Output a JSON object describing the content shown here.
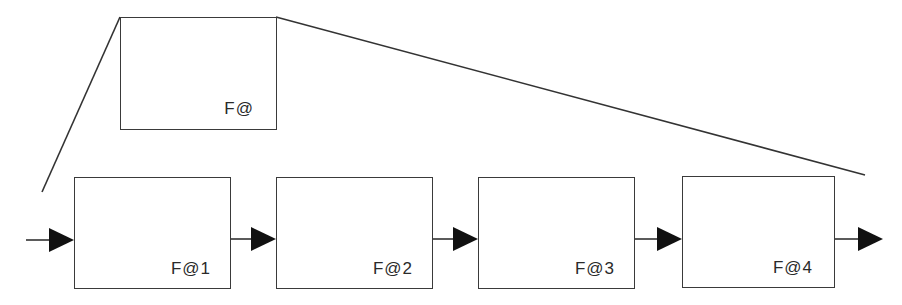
{
  "diagram": {
    "type": "unrolled-block-chain",
    "stroke_color": "#333333",
    "arrow_color": "#111111",
    "template_block": {
      "label": "F@",
      "x": 120,
      "y": 17,
      "w": 156,
      "h": 112
    },
    "expansion_lines": [
      {
        "from": [
          120,
          17
        ],
        "to": [
          42,
          192
        ]
      },
      {
        "from": [
          276,
          17
        ],
        "to": [
          865,
          175
        ]
      }
    ],
    "blocks": [
      {
        "label": "F@1",
        "x": 74,
        "y": 177,
        "w": 156,
        "h": 111
      },
      {
        "label": "F@2",
        "x": 276,
        "y": 177,
        "w": 156,
        "h": 111
      },
      {
        "label": "F@3",
        "x": 478,
        "y": 177,
        "w": 156,
        "h": 111
      },
      {
        "label": "F@4",
        "x": 682,
        "y": 176,
        "w": 152,
        "h": 111
      }
    ],
    "arrows": [
      {
        "from": [
          26,
          240
        ],
        "to": [
          74,
          240
        ]
      },
      {
        "from": [
          230,
          239
        ],
        "to": [
          276,
          239
        ]
      },
      {
        "from": [
          432,
          239
        ],
        "to": [
          478,
          239
        ]
      },
      {
        "from": [
          634,
          239
        ],
        "to": [
          682,
          239
        ]
      },
      {
        "from": [
          834,
          239
        ],
        "to": [
          883,
          239
        ]
      }
    ]
  }
}
